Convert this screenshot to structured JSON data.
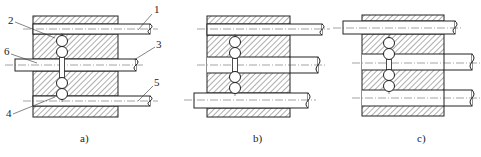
{
  "figure": {
    "width": 481,
    "height": 157,
    "background": "#ffffff",
    "ink": "#222222"
  },
  "panels": [
    {
      "id": "a",
      "caption": "a)",
      "caption_pos": [
        80,
        142
      ],
      "body": {
        "x": 33,
        "y": 16,
        "w": 85,
        "h": 101
      },
      "rods": [
        {
          "y1": 24,
          "y2": 34,
          "x1": 33,
          "x2": 150,
          "cl": 29
        },
        {
          "y1": 59,
          "y2": 71,
          "x1": 15,
          "x2": 136,
          "cl": 65
        },
        {
          "y1": 96,
          "y2": 106,
          "x1": 33,
          "x2": 150,
          "cl": 101
        }
      ],
      "balls": [
        {
          "cx": 62,
          "cy": 41
        },
        {
          "cx": 62,
          "cy": 52
        },
        {
          "cx": 62,
          "cy": 83
        },
        {
          "cx": 62,
          "cy": 94
        }
      ],
      "labels": [
        {
          "text": "1",
          "x": 154,
          "y": 13,
          "lx1": 152,
          "ly1": 14,
          "lx2": 138,
          "ly2": 30
        },
        {
          "text": "2",
          "x": 8,
          "y": 24,
          "lx1": 15,
          "ly1": 22,
          "lx2": 55,
          "ly2": 38
        },
        {
          "text": "3",
          "x": 156,
          "y": 48,
          "lx1": 155,
          "ly1": 47,
          "lx2": 134,
          "ly2": 60
        },
        {
          "text": "6",
          "x": 4,
          "y": 55,
          "lx1": 11,
          "ly1": 54,
          "lx2": 37,
          "ly2": 63
        },
        {
          "text": "5",
          "x": 154,
          "y": 86,
          "lx1": 153,
          "ly1": 86,
          "lx2": 138,
          "ly2": 101
        },
        {
          "text": "4",
          "x": 6,
          "y": 117,
          "lx1": 13,
          "ly1": 114,
          "lx2": 55,
          "ly2": 97
        }
      ]
    },
    {
      "id": "b",
      "caption": "b)",
      "caption_pos": [
        253,
        142
      ],
      "body": {
        "x": 207,
        "y": 16,
        "w": 83,
        "h": 101
      },
      "rods": [
        {
          "y1": 24,
          "y2": 35,
          "x1": 207,
          "x2": 322,
          "cl": 29
        },
        {
          "y1": 57,
          "y2": 73,
          "x1": 290,
          "x2": 318,
          "cl": 65
        },
        {
          "y1": 93,
          "y2": 108,
          "x1": 194,
          "x2": 308,
          "cl": 100
        }
      ],
      "balls": [
        {
          "cx": 235,
          "cy": 42
        },
        {
          "cx": 235,
          "cy": 53
        },
        {
          "cx": 235,
          "cy": 77
        },
        {
          "cx": 235,
          "cy": 88
        }
      ],
      "labels": []
    },
    {
      "id": "c",
      "caption": "c)",
      "caption_pos": [
        417,
        142
      ],
      "body": {
        "x": 362,
        "y": 15,
        "w": 82,
        "h": 101
      },
      "rods": [
        {
          "y1": 21,
          "y2": 34,
          "x1": 343,
          "x2": 455,
          "cl": 28
        },
        {
          "y1": 54,
          "y2": 70,
          "x1": 444,
          "x2": 472,
          "cl": 63
        },
        {
          "y1": 90,
          "y2": 106,
          "x1": 444,
          "x2": 472,
          "cl": 98
        }
      ],
      "balls": [
        {
          "cx": 389,
          "cy": 43
        },
        {
          "cx": 389,
          "cy": 54
        },
        {
          "cx": 389,
          "cy": 75
        },
        {
          "cx": 389,
          "cy": 86
        }
      ],
      "labels": []
    }
  ]
}
